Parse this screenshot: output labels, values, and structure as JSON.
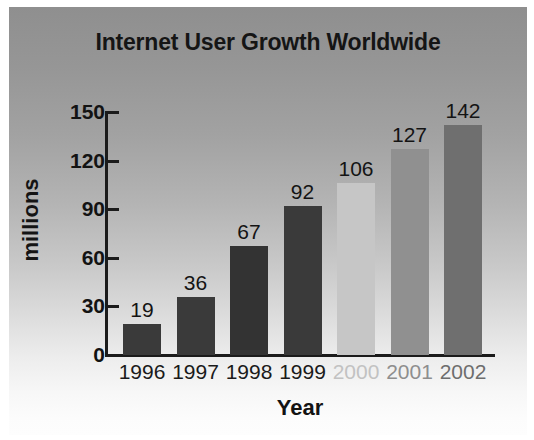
{
  "chart_data": {
    "type": "bar",
    "title": "Internet User Growth Worldwide",
    "xlabel": "Year",
    "ylabel": "millions",
    "categories": [
      "1996",
      "1997",
      "1998",
      "1999",
      "2000",
      "2001",
      "2002"
    ],
    "values": [
      19,
      36,
      67,
      92,
      106,
      127,
      142
    ],
    "value_labels": [
      "19",
      "36",
      "67",
      "92",
      "106",
      "127",
      "142"
    ],
    "bar_colors": [
      "#3a3a3a",
      "#3a3a3a",
      "#333333",
      "#3a3a3a",
      "#c6c6c6",
      "#909090",
      "#6f6f6f"
    ],
    "category_label_colors": [
      "#1a1a1a",
      "#1a1a1a",
      "#1a1a1a",
      "#1a1a1a",
      "#c2c2c2",
      "#8e8e8e",
      "#6d6d6d"
    ],
    "ylim": [
      0,
      150
    ],
    "yticks": [
      0,
      30,
      60,
      90,
      120,
      150
    ],
    "ytick_labels": [
      "0",
      "30",
      "60",
      "90",
      "120",
      "150"
    ],
    "grid": false,
    "legend": false,
    "legend_position": "none",
    "annotations": [
      "Bars for 2000, 2001 and 2002 are drawn in lighter shades, indicating projected values.",
      "Data value is printed above each bar."
    ]
  },
  "style": {
    "background_top": "#8f8f8f",
    "background_bottom": "#fdfdfd",
    "axis_color": "#1b1b1b",
    "text_color": "#141414",
    "page_border": "#ffffff"
  }
}
